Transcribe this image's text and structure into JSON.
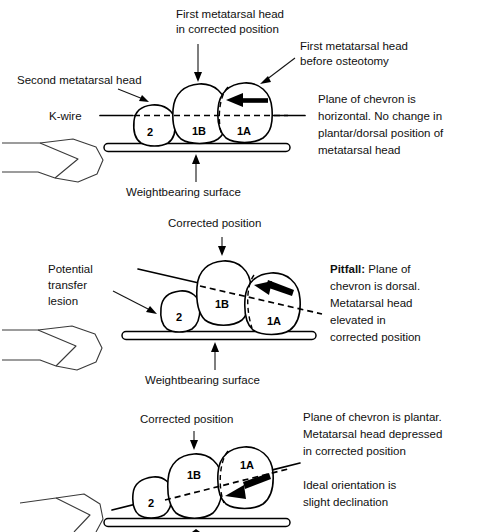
{
  "figure": {
    "background_color": "#ffffff",
    "ink_color": "#000000"
  },
  "panels": [
    {
      "id": "panel-horizontal",
      "labels": {
        "top_center_line1": "First metatarsal head",
        "top_center_line2": "in corrected position",
        "top_right_line1": "First metatarsal head",
        "top_right_line2": "before osteotomy",
        "left_upper": "Second metatarsal head",
        "left_kwire": "K-wire",
        "bottom_center": "Weightbearing surface",
        "body_line1": "Plane of chevron is",
        "body_line2": "horizontal.  No change in",
        "body_line3": "plantar/dorsal position of",
        "body_line4": "metatarsal head"
      },
      "bones": [
        {
          "name": "second-metatarsal-head",
          "label": "2"
        },
        {
          "name": "first-metatarsal-head-corrected",
          "label": "1B"
        },
        {
          "name": "first-metatarsal-head-original",
          "label": "1A"
        }
      ]
    },
    {
      "id": "panel-dorsal",
      "labels": {
        "top_center": "Corrected position",
        "left_line1": "Potential",
        "left_line2": "transfer",
        "left_line3": "lesion",
        "bottom_center": "Weightbearing surface",
        "body_bold": "Pitfall:",
        "body_line1_rest": " Plane of",
        "body_line2": "chevron is dorsal.",
        "body_line3": "Metatarsal head",
        "body_line4": "elevated in",
        "body_line5": "corrected position"
      },
      "bones": [
        {
          "name": "second-metatarsal-head",
          "label": "2"
        },
        {
          "name": "first-metatarsal-head-corrected",
          "label": "1B"
        },
        {
          "name": "first-metatarsal-head-original",
          "label": "1A"
        }
      ]
    },
    {
      "id": "panel-plantar",
      "labels": {
        "top_center": "Corrected position",
        "body_line1": "Plane of chevron is plantar.",
        "body_line2": "Metatarsal head depressed",
        "body_line3": "in corrected position",
        "body_line4": "Ideal orientation is",
        "body_line5": "slight declination"
      },
      "bones": [
        {
          "name": "second-metatarsal-head",
          "label": "2"
        },
        {
          "name": "first-metatarsal-head-corrected",
          "label": "1B"
        },
        {
          "name": "first-metatarsal-head-original",
          "label": "1A"
        }
      ]
    }
  ]
}
